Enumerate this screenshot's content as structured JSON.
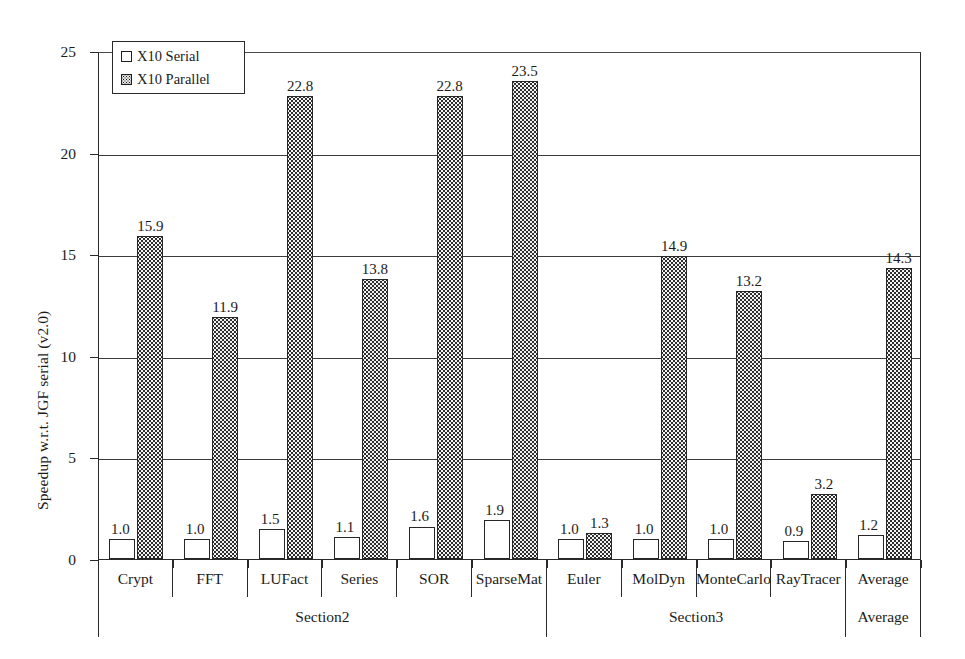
{
  "chart_data": {
    "type": "bar",
    "title": "",
    "xlabel": "",
    "ylabel": "Speedup w.r.t. JGF serial (v2.0)",
    "ylim": [
      0,
      25
    ],
    "yticks": [
      "0",
      "5",
      "10",
      "15",
      "20",
      "25"
    ],
    "grid": true,
    "legend_position": "top-left",
    "categories": [
      "Crypt",
      "FFT",
      "LUFact",
      "Series",
      "SOR",
      "SparseMat",
      "Euler",
      "MolDyn",
      "MonteCarlo",
      "RayTracer",
      "Average"
    ],
    "series": [
      {
        "name": "X10 Serial",
        "values": [
          1.0,
          1.0,
          1.5,
          1.1,
          1.6,
          1.9,
          1.0,
          1.0,
          1.0,
          0.9,
          1.2
        ],
        "labels": [
          "1.0",
          "1.0",
          "1.5",
          "1.1",
          "1.6",
          "1.9",
          "1.0",
          "1.0",
          "1.0",
          "0.9",
          "1.2"
        ]
      },
      {
        "name": "X10 Parallel",
        "values": [
          15.9,
          11.9,
          22.8,
          13.8,
          22.8,
          23.5,
          1.3,
          14.9,
          13.2,
          3.2,
          14.3
        ],
        "labels": [
          "15.9",
          "11.9",
          "22.8",
          "13.8",
          "22.8",
          "23.5",
          "1.3",
          "14.9",
          "13.2",
          "3.2",
          "14.3"
        ]
      }
    ],
    "groups": [
      {
        "label": "Section2",
        "categories": [
          "Crypt",
          "FFT",
          "LUFact",
          "Series",
          "SOR",
          "SparseMat"
        ]
      },
      {
        "label": "Section3",
        "categories": [
          "Euler",
          "MolDyn",
          "MonteCarlo",
          "RayTracer"
        ]
      },
      {
        "label": "Average",
        "categories": [
          "Average"
        ]
      }
    ]
  },
  "legend": {
    "entries": [
      {
        "label": "X10 Serial",
        "swatch": "white-square-icon"
      },
      {
        "label": "X10 Parallel",
        "swatch": "dotted-square-icon"
      }
    ]
  },
  "colors": {
    "axis": "#2a2a2a",
    "grid": "#3b3b3b",
    "serial_fill": "#ffffff",
    "parallel_fill": "#f3f3f3",
    "text": "#1c1c1c"
  }
}
